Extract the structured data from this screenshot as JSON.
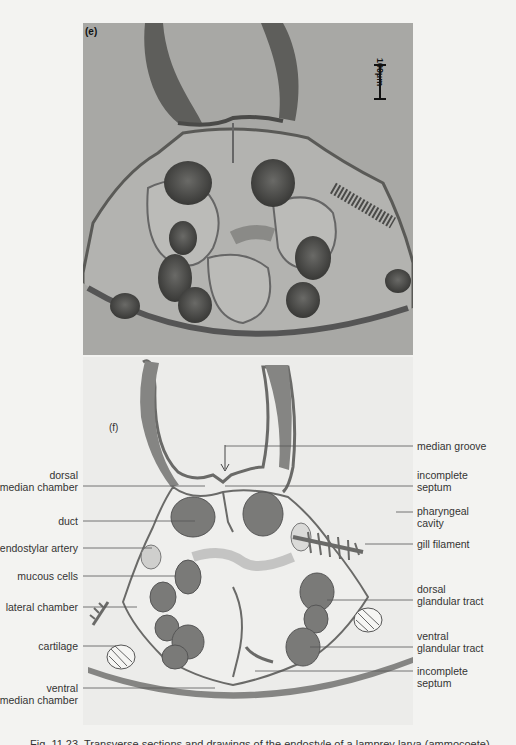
{
  "figure": {
    "photo_panel": {
      "letter": "(e)",
      "scale_bar": "100µm"
    },
    "drawing_panel": {
      "letter": "(f)",
      "labels_left": [
        {
          "id": "dorsal-median-chamber",
          "lines": [
            "dorsal",
            "median chamber"
          ]
        },
        {
          "id": "duct",
          "lines": [
            "duct"
          ]
        },
        {
          "id": "endostylar-artery",
          "lines": [
            "endostylar artery"
          ]
        },
        {
          "id": "mucous-cells",
          "lines": [
            "mucous cells"
          ]
        },
        {
          "id": "lateral-chamber",
          "lines": [
            "lateral chamber"
          ]
        },
        {
          "id": "cartilage",
          "lines": [
            "cartilage"
          ]
        },
        {
          "id": "ventral-median-chamber",
          "lines": [
            "ventral",
            "median chamber"
          ]
        }
      ],
      "labels_right": [
        {
          "id": "median-groove",
          "lines": [
            "median groove"
          ]
        },
        {
          "id": "incomplete-septum-dorsal",
          "lines": [
            "incomplete",
            "septum"
          ]
        },
        {
          "id": "pharyngeal-cavity",
          "lines": [
            "pharyngeal",
            "cavity"
          ]
        },
        {
          "id": "gill-filament",
          "lines": [
            "gill filament"
          ]
        },
        {
          "id": "dorsal-glandular-tract",
          "lines": [
            "dorsal",
            "glandular tract"
          ]
        },
        {
          "id": "ventral-glandular-tract",
          "lines": [
            "ventral",
            "glandular tract"
          ]
        },
        {
          "id": "incomplete-septum-ventral",
          "lines": [
            "incomplete",
            "septum"
          ]
        }
      ]
    },
    "caption": "Fig. 11.23. Transverse sections and drawings of the endostyle of a lamprey larva (ammocoete)"
  },
  "colors": {
    "page_bg": "#f3f3f1",
    "photo_bg": "#a9a9a6",
    "tissue_dark": "#4a4a48",
    "tissue_mid": "#6e6e6b",
    "drawing_fill": "#858583",
    "leader_line": "#555555"
  }
}
